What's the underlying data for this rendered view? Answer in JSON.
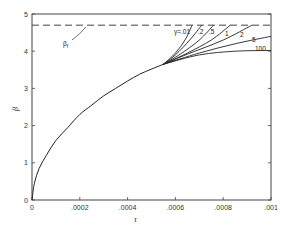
{
  "chart_data": {
    "type": "line",
    "title": "",
    "xlabel": "τ",
    "ylabel": "β",
    "xlim": [
      0,
      0.001
    ],
    "ylim": [
      0,
      5
    ],
    "grid": false,
    "x_ticks": [
      "0",
      ".0002",
      ".0004",
      ".0006",
      ".0008",
      ".001"
    ],
    "x_tick_values": [
      0,
      0.0002,
      0.0004,
      0.0006,
      0.0008,
      0.001
    ],
    "y_ticks": [
      "0",
      "1",
      "2",
      "3",
      "4",
      "5"
    ],
    "y_tick_values": [
      0,
      1,
      2,
      3,
      4,
      5
    ],
    "reference_line": {
      "label": "β_f",
      "label_main": "β",
      "label_sub": "f",
      "value": 4.7,
      "style": "dashed"
    },
    "common_curve": {
      "x": [
        0,
        1e-05,
        3e-05,
        6e-05,
        0.0001,
        0.00015,
        0.0002,
        0.00025,
        0.0003,
        0.00035,
        0.0004,
        0.00045,
        0.0005,
        0.00055
      ],
      "y": [
        0,
        0.45,
        0.85,
        1.2,
        1.6,
        1.95,
        2.3,
        2.55,
        2.8,
        3.0,
        3.2,
        3.38,
        3.52,
        3.65
      ]
    },
    "series": [
      {
        "name": "γ=.01",
        "label": "γ=.01",
        "x": [
          0.00055,
          0.0006,
          0.00064,
          0.00067
        ],
        "y": [
          3.65,
          3.95,
          4.3,
          4.7
        ]
      },
      {
        "name": ".2",
        "label": ".2",
        "x": [
          0.00055,
          0.0006,
          0.00066,
          0.00071
        ],
        "y": [
          3.65,
          3.9,
          4.3,
          4.7
        ]
      },
      {
        "name": ".5",
        "label": ".5",
        "x": [
          0.00055,
          0.00062,
          0.0007,
          0.00076
        ],
        "y": [
          3.65,
          3.92,
          4.3,
          4.7
        ]
      },
      {
        "name": "1",
        "label": "1",
        "x": [
          0.00055,
          0.00065,
          0.00075,
          0.00083
        ],
        "y": [
          3.65,
          3.95,
          4.3,
          4.7
        ]
      },
      {
        "name": "2",
        "label": "2",
        "x": [
          0.00055,
          0.00065,
          0.0008,
          0.00092
        ],
        "y": [
          3.65,
          3.92,
          4.3,
          4.7
        ]
      },
      {
        "name": "5",
        "label": "5",
        "x": [
          0.00055,
          0.0007,
          0.00085,
          0.001
        ],
        "y": [
          3.65,
          3.95,
          4.2,
          4.4
        ]
      },
      {
        "name": "100",
        "label": "100",
        "x": [
          0.00055,
          0.0007,
          0.00085,
          0.001
        ],
        "y": [
          3.65,
          3.9,
          4.0,
          4.02
        ]
      }
    ],
    "annotations": [
      "β_f",
      "γ=.01",
      ".2",
      ".5",
      "1",
      "2",
      "5",
      "100"
    ]
  },
  "labels": {
    "x_axis_title": "τ",
    "y_axis_title": "β",
    "ref_label_main": "β",
    "ref_label_sub": "f",
    "gamma_prefix": "γ=.01"
  }
}
